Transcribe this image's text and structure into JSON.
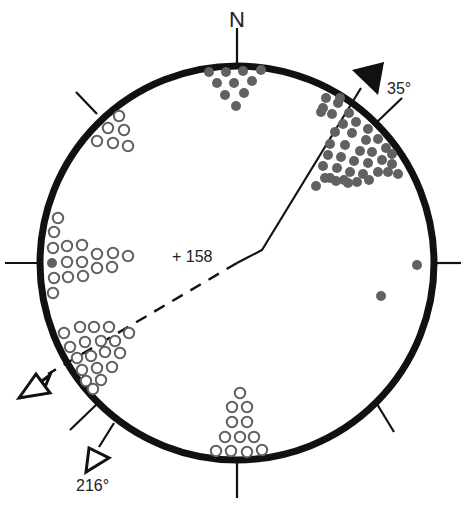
{
  "diagram": {
    "type": "stereonet",
    "north_label": "N",
    "center_label": "+ 158",
    "center_value": "158",
    "trend_up": {
      "label": "35°",
      "azimuth_deg": 35,
      "line_style": "solid",
      "arrowhead": "filled"
    },
    "trend_down": {
      "label": "216°",
      "azimuth_deg": 216,
      "line_style": "solid",
      "arrowhead": "open"
    },
    "dashed_line": {
      "azimuth_deg": 240,
      "line_style": "dashed",
      "arrowhead": "open"
    },
    "colors": {
      "circle": "#111111",
      "filled_dot": "#616161",
      "open_dot_stroke": "#616161",
      "text": "#222222"
    },
    "legend_symbols": {
      "filled": "filled circle (lower-hemisphere pole)",
      "open": "open circle (upper-hemisphere pole)"
    },
    "clusters": [
      {
        "name": "north-filled-cluster",
        "symbol": "filled",
        "count": 10
      },
      {
        "name": "northeast-filled-cluster",
        "symbol": "filled",
        "count": 41
      },
      {
        "name": "east-filled-points",
        "symbol": "filled",
        "count": 2
      },
      {
        "name": "northwest-open-cluster",
        "symbol": "open",
        "count": 6
      },
      {
        "name": "west-open-cluster",
        "symbol": "open",
        "count": 18,
        "filled_count": 1
      },
      {
        "name": "southwest-open-cluster",
        "symbol": "open",
        "count": 23
      },
      {
        "name": "south-open-cluster",
        "symbol": "open",
        "count": 14
      }
    ]
  }
}
